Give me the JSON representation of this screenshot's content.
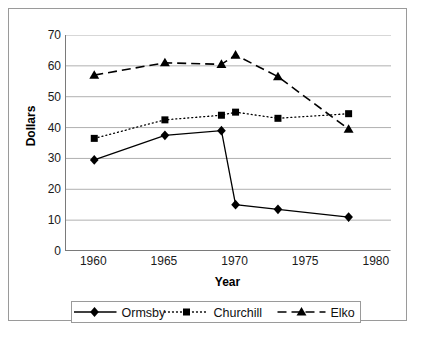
{
  "chart_data": {
    "type": "line",
    "title": "",
    "xlabel": "Year",
    "ylabel": "Dollars",
    "xlim": [
      1958,
      1981
    ],
    "ylim": [
      0,
      70
    ],
    "grid": true,
    "legend_position": "bottom",
    "x_ticks": [
      "1960",
      "1965",
      "1970",
      "1975",
      "1980"
    ],
    "x_tick_values": [
      1960,
      1965,
      1970,
      1975,
      1980
    ],
    "y_ticks": [
      "0",
      "10",
      "20",
      "30",
      "40",
      "50",
      "60",
      "70"
    ],
    "y_tick_values": [
      0,
      10,
      20,
      30,
      40,
      50,
      60,
      70
    ],
    "x": [
      1960,
      1965,
      1969,
      1970,
      1973,
      1978
    ],
    "series": [
      {
        "name": "Ormsby",
        "marker": "diamond",
        "line_style": "solid",
        "color": "#000000",
        "values": [
          29.5,
          37.5,
          39.0,
          15.0,
          13.5,
          11.0
        ]
      },
      {
        "name": "Churchill",
        "marker": "square",
        "line_style": "dotted",
        "color": "#000000",
        "values": [
          36.5,
          42.5,
          44.0,
          45.0,
          43.0,
          44.5
        ]
      },
      {
        "name": "Elko",
        "marker": "triangle",
        "line_style": "dashed",
        "color": "#000000",
        "values": [
          57.0,
          61.0,
          60.5,
          63.5,
          56.5,
          39.5
        ]
      }
    ]
  },
  "axes": {
    "y_title": "Dollars",
    "x_title": "Year"
  },
  "legend": {
    "items": [
      {
        "label": "Ormsby"
      },
      {
        "label": "Churchill"
      },
      {
        "label": "Elko"
      }
    ]
  },
  "colors": {
    "ink": "#000000",
    "gridline": "#b0b0b0",
    "axis": "#7a7a7a",
    "frame": "#9a9a9a",
    "background": "#ffffff"
  }
}
